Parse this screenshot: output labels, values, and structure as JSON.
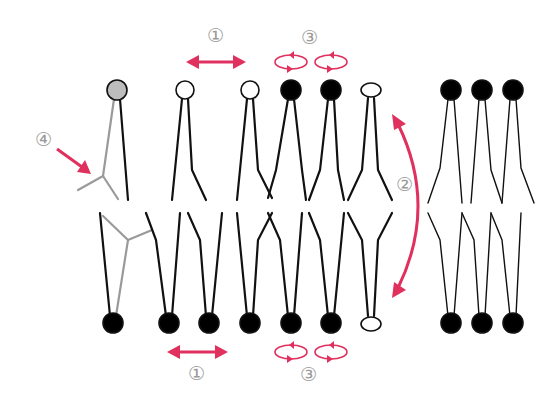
{
  "colors": {
    "accent": "#e0305e",
    "lipid": "#111111",
    "cholesterol": "#9a9a9a",
    "head_filled": "#000000",
    "head_open": "#ffffff",
    "head_gray": "#bdbdbd",
    "label": "#9a9a9a"
  },
  "labels": {
    "lateral_top": "①",
    "lateral_bottom": "①",
    "flipflop": "②",
    "rotation_top": "③",
    "rotation_bottom": "③",
    "cholesterol": "④"
  },
  "legend": [
    {
      "number": "①",
      "meaning": "lateral diffusion",
      "icon": "double-arrow-icon"
    },
    {
      "number": "②",
      "meaning": "flip-flop (transverse diffusion)",
      "icon": "curved-double-arrow-icon"
    },
    {
      "number": "③",
      "meaning": "rotation",
      "icon": "rotation-ellipse-icon"
    },
    {
      "number": "④",
      "meaning": "inserted molecule (gray)",
      "icon": "arrow-icon"
    }
  ],
  "top_leaflet_heads": [
    {
      "x": 117,
      "fill": "gray"
    },
    {
      "x": 185,
      "fill": "open"
    },
    {
      "x": 250,
      "fill": "open"
    },
    {
      "x": 291,
      "fill": "filled"
    },
    {
      "x": 331,
      "fill": "filled"
    },
    {
      "x": 371,
      "fill": "open-oval"
    },
    {
      "x": 451,
      "fill": "filled"
    },
    {
      "x": 482,
      "fill": "filled"
    },
    {
      "x": 513,
      "fill": "filled"
    }
  ],
  "bottom_leaflet_heads": [
    {
      "x": 113,
      "fill": "filled"
    },
    {
      "x": 169,
      "fill": "filled"
    },
    {
      "x": 209,
      "fill": "filled"
    },
    {
      "x": 250,
      "fill": "filled"
    },
    {
      "x": 291,
      "fill": "filled"
    },
    {
      "x": 331,
      "fill": "filled"
    },
    {
      "x": 371,
      "fill": "open-oval"
    },
    {
      "x": 451,
      "fill": "filled"
    },
    {
      "x": 482,
      "fill": "filled"
    },
    {
      "x": 513,
      "fill": "filled"
    }
  ]
}
